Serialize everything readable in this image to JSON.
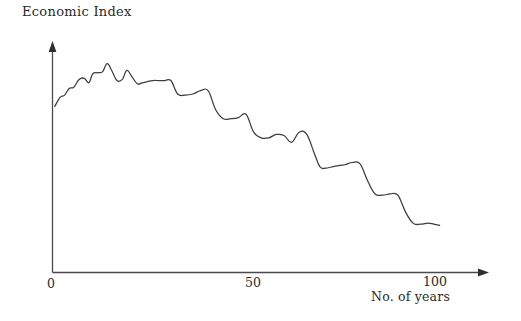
{
  "chart_data": {
    "type": "line",
    "title": "",
    "ylabel": "Economic Index",
    "xlabel": "No. of years",
    "xticks": [
      "0",
      "50",
      "100"
    ],
    "xtick_values": [
      0,
      50,
      100
    ],
    "yticks": [],
    "xlim": [
      0,
      105
    ],
    "ylim": [
      0,
      100
    ],
    "grid": false,
    "legend": null,
    "line_color": "#3d3d3d",
    "axis_color": "#4a4a4a",
    "series": [
      {
        "name": "Economic Index",
        "description": "Long-term declining economic index drawn as a hand-sketched descending staircase with small plateaus and drops",
        "x": [
          0.6,
          2.0,
          3.2,
          4.4,
          5.6,
          7.0,
          8.4,
          9.6,
          10.6,
          12.0,
          13.2,
          14.4,
          15.6,
          17.0,
          18.4,
          19.6,
          21.0,
          22.4,
          23.6,
          25.0,
          26.4,
          28.0,
          29.6,
          31.2,
          33.0,
          35.0,
          37.0,
          39.0,
          41.0,
          43.0,
          45.0,
          47.0,
          49.0,
          51.0,
          53.0,
          55.0,
          57.0,
          59.0,
          61.0,
          63.0,
          65.0,
          67.0,
          69.0,
          70.5,
          72.0,
          73.5,
          75.0,
          77.0,
          79.0,
          81.0,
          83.0,
          85.0,
          87.0,
          89.0,
          91.0,
          93.0,
          95.0,
          97.0,
          99.0,
          100.5,
          102.0
        ],
        "y": [
          74.0,
          78.0,
          79.0,
          82.0,
          82.5,
          86.0,
          86.5,
          84.5,
          88.5,
          89.0,
          89.5,
          93.0,
          90.0,
          85.5,
          86.0,
          90.0,
          87.0,
          84.0,
          84.5,
          85.0,
          85.5,
          85.5,
          85.5,
          85.5,
          79.5,
          79.0,
          79.5,
          81.0,
          81.0,
          72.5,
          68.5,
          68.5,
          69.0,
          70.5,
          62.5,
          60.0,
          60.0,
          61.5,
          61.0,
          58.0,
          62.5,
          61.5,
          53.0,
          47.0,
          46.5,
          47.0,
          47.5,
          48.0,
          49.0,
          48.5,
          41.0,
          35.0,
          34.5,
          35.0,
          34.5,
          27.0,
          22.0,
          21.5,
          22.0,
          21.5,
          21.0
        ]
      }
    ],
    "annotations": [
      {
        "text": "Economic Index",
        "role": "y-axis-title",
        "x": 22,
        "y": 12
      },
      {
        "text": "No. of years",
        "role": "x-axis-title",
        "x": 371,
        "y": 296
      }
    ]
  },
  "axes": {
    "y_title": "Economic Index",
    "x_title": "No. of years",
    "x_tick_labels": {
      "zero": "0",
      "fifty": "50",
      "hundred": "100"
    }
  },
  "colors": {
    "curve": "#3d3d3d",
    "axis": "#4a4a4a",
    "text": "#2b2b2b",
    "background": "#ffffff"
  }
}
